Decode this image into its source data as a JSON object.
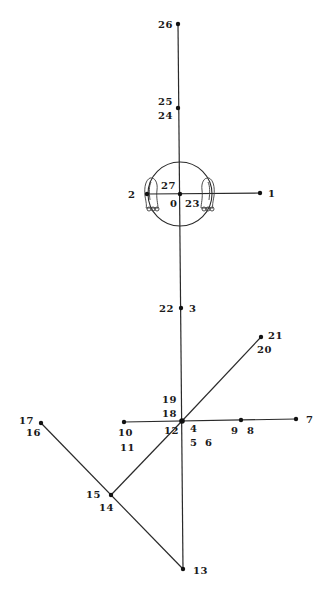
{
  "diagram": {
    "title": "",
    "colors": {
      "line": "#2a2a2a",
      "point": "#111111",
      "label": "#1a1a1a",
      "background": "#ffffff"
    },
    "nodes": [
      {
        "id": "n26",
        "x": 178,
        "y": 24
      },
      {
        "id": "n24",
        "x": 178,
        "y": 108
      },
      {
        "id": "n0",
        "x": 180,
        "y": 194
      },
      {
        "id": "n2",
        "x": 147,
        "y": 194
      },
      {
        "id": "n1",
        "x": 260,
        "y": 193
      },
      {
        "id": "n3",
        "x": 181,
        "y": 308
      },
      {
        "id": "n21",
        "x": 261,
        "y": 337
      },
      {
        "id": "n12",
        "x": 182,
        "y": 421
      },
      {
        "id": "n10",
        "x": 124,
        "y": 422
      },
      {
        "id": "n9",
        "x": 241,
        "y": 420
      },
      {
        "id": "n7",
        "x": 296,
        "y": 419
      },
      {
        "id": "n15",
        "x": 111,
        "y": 495
      },
      {
        "id": "n17",
        "x": 41,
        "y": 423
      },
      {
        "id": "n13",
        "x": 183,
        "y": 569
      }
    ],
    "edges": [
      [
        "n26",
        "n13"
      ],
      [
        "n2",
        "n1"
      ],
      [
        "n10",
        "n7"
      ],
      [
        "n12",
        "n21"
      ],
      [
        "n12",
        "n15"
      ],
      [
        "n17",
        "n13"
      ]
    ],
    "head": {
      "cx": 180,
      "cy": 194,
      "r": 32
    },
    "labels": [
      {
        "text": "26",
        "x": 158,
        "y": 28
      },
      {
        "text": "25",
        "x": 158,
        "y": 105
      },
      {
        "text": "24",
        "x": 158,
        "y": 119
      },
      {
        "text": "27",
        "x": 161,
        "y": 189
      },
      {
        "text": "2",
        "x": 128,
        "y": 198
      },
      {
        "text": "1",
        "x": 268,
        "y": 197
      },
      {
        "text": "0",
        "x": 170,
        "y": 207
      },
      {
        "text": "23",
        "x": 185,
        "y": 207
      },
      {
        "text": "22",
        "x": 159,
        "y": 312
      },
      {
        "text": "3",
        "x": 189,
        "y": 312
      },
      {
        "text": "21",
        "x": 268,
        "y": 339
      },
      {
        "text": "20",
        "x": 257,
        "y": 353
      },
      {
        "text": "19",
        "x": 162,
        "y": 403
      },
      {
        "text": "18",
        "x": 162,
        "y": 417
      },
      {
        "text": "7",
        "x": 306,
        "y": 423
      },
      {
        "text": "10",
        "x": 118,
        "y": 436
      },
      {
        "text": "12",
        "x": 164,
        "y": 434
      },
      {
        "text": "4",
        "x": 190,
        "y": 432
      },
      {
        "text": "9",
        "x": 231,
        "y": 434
      },
      {
        "text": "8",
        "x": 247,
        "y": 434
      },
      {
        "text": "11",
        "x": 120,
        "y": 451
      },
      {
        "text": "5",
        "x": 190,
        "y": 446
      },
      {
        "text": "6",
        "x": 205,
        "y": 446
      },
      {
        "text": "17",
        "x": 19,
        "y": 424
      },
      {
        "text": "16",
        "x": 26,
        "y": 436
      },
      {
        "text": "15",
        "x": 86,
        "y": 498
      },
      {
        "text": "14",
        "x": 99,
        "y": 511
      },
      {
        "text": "13",
        "x": 193,
        "y": 574
      }
    ]
  }
}
